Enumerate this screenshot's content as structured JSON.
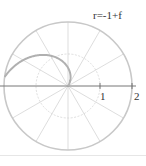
{
  "chart_data": {
    "type": "line",
    "subtype": "polar",
    "title": "",
    "annotation": "r=-1+f",
    "equation": "r = -1 + theta",
    "theta_range": [
      1,
      3
    ],
    "radial_ticks": [
      1,
      2
    ],
    "radial_tick_labels": [
      "1",
      "2"
    ],
    "rmax": 2,
    "angular_grid_step_deg": 30,
    "grid": true,
    "legend": null,
    "points": [
      {
        "theta": 1.0,
        "r": 0.0
      },
      {
        "theta": 1.5,
        "r": 0.5
      },
      {
        "theta": 2.0,
        "r": 1.0
      },
      {
        "theta": 2.5,
        "r": 1.5
      },
      {
        "theta": 3.0,
        "r": 2.0
      }
    ]
  },
  "colors": {
    "curve": "#b0b0b0",
    "grid": "#d4d4d4",
    "outer_circle": "#c8c8c8",
    "axis": "#777777",
    "text": "#333333"
  },
  "labels": {
    "equation": "r=-1+f",
    "tick_1": "1",
    "tick_2": "2"
  }
}
